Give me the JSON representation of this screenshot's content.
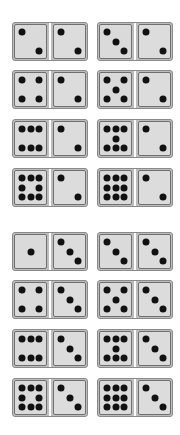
{
  "colors": {
    "pip": "#111111",
    "face": "#dadada",
    "border": "#6f6f6f",
    "background": "#ffffff"
  },
  "groups": [
    {
      "name": "top-group",
      "tiles": [
        {
          "row": 0,
          "col": 0,
          "left": 2,
          "right": 2
        },
        {
          "row": 0,
          "col": 1,
          "left": 3,
          "right": 2
        },
        {
          "row": 1,
          "col": 0,
          "left": 4,
          "right": 2
        },
        {
          "row": 1,
          "col": 1,
          "left": 5,
          "right": 2
        },
        {
          "row": 2,
          "col": 0,
          "left": 6,
          "right": 2
        },
        {
          "row": 2,
          "col": 1,
          "left": 7,
          "right": 2
        },
        {
          "row": 3,
          "col": 0,
          "left": 8,
          "right": 2
        },
        {
          "row": 3,
          "col": 1,
          "left": 9,
          "right": 2
        }
      ]
    },
    {
      "name": "bottom-group",
      "tiles": [
        {
          "row": 4,
          "col": 0,
          "left": 1,
          "right": 3
        },
        {
          "row": 4,
          "col": 1,
          "left": 3,
          "right": 3
        },
        {
          "row": 5,
          "col": 0,
          "left": 4,
          "right": 3
        },
        {
          "row": 5,
          "col": 1,
          "left": 5,
          "right": 3
        },
        {
          "row": 6,
          "col": 0,
          "left": 6,
          "right": 3
        },
        {
          "row": 6,
          "col": 1,
          "left": 7,
          "right": 3
        },
        {
          "row": 7,
          "col": 0,
          "left": 8,
          "right": 3
        },
        {
          "row": 7,
          "col": 1,
          "left": 9,
          "right": 3
        }
      ]
    }
  ]
}
